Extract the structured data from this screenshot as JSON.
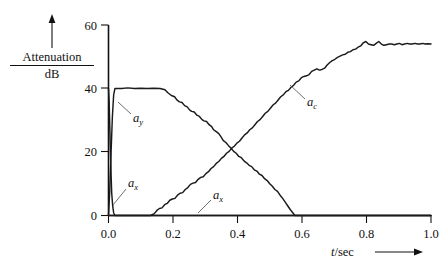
{
  "figure": {
    "background_color": "#ffffff",
    "curve_color": "#1a1a1a",
    "axis_color": "#111111"
  },
  "axes": {
    "y_label_numerator": "Attenuation",
    "y_label_denominator": "dB",
    "y_ticks": [
      "0",
      "20",
      "40",
      "60"
    ],
    "y_tick_values": [
      0,
      20,
      40,
      60
    ],
    "x_ticks": [
      "0.0",
      "0.2",
      "0.4",
      "0.6",
      "0.8",
      "1.0"
    ],
    "x_tick_values": [
      0.0,
      0.2,
      0.4,
      0.6,
      0.8,
      1.0
    ],
    "x_label_italic": "t",
    "x_label_rest": "/sec",
    "x_label": "t/sec"
  },
  "annotations": [
    {
      "name": "label-ay",
      "base": "a",
      "sub": "y",
      "x": 0.35,
      "y": 0.38
    },
    {
      "name": "label-ax-left",
      "base": "a",
      "sub": "x",
      "x": 0.36,
      "y": 0.73
    },
    {
      "name": "label-ax-baseline",
      "base": "a",
      "sub": "x",
      "x": 0.49,
      "y": 0.76
    },
    {
      "name": "label-ac",
      "base": "a",
      "sub": "c",
      "x": 0.73,
      "y": 0.33
    }
  ],
  "chart_data": {
    "type": "line",
    "title": "",
    "xlabel": "t/sec",
    "ylabel": "Attenuation / dB",
    "xlim": [
      0.0,
      1.0
    ],
    "ylim": [
      0,
      60
    ],
    "grid": false,
    "legend": "inline-annotations",
    "series": [
      {
        "name": "a_y",
        "label": "a_y",
        "points": [
          [
            0.0,
            0.0
          ],
          [
            0.004,
            8.0
          ],
          [
            0.008,
            20.0
          ],
          [
            0.012,
            31.0
          ],
          [
            0.016,
            38.0
          ],
          [
            0.02,
            40.0
          ],
          [
            0.04,
            40.0
          ],
          [
            0.06,
            40.2
          ],
          [
            0.08,
            40.0
          ],
          [
            0.1,
            40.1
          ],
          [
            0.12,
            40.0
          ],
          [
            0.14,
            40.1
          ],
          [
            0.16,
            40.0
          ],
          [
            0.175,
            39.6
          ],
          [
            0.185,
            38.6
          ],
          [
            0.195,
            37.8
          ],
          [
            0.205,
            37.4
          ],
          [
            0.212,
            36.4
          ],
          [
            0.22,
            35.8
          ],
          [
            0.228,
            35.6
          ],
          [
            0.236,
            34.6
          ],
          [
            0.244,
            34.2
          ],
          [
            0.252,
            33.2
          ],
          [
            0.258,
            32.8
          ],
          [
            0.266,
            32.6
          ],
          [
            0.274,
            31.6
          ],
          [
            0.282,
            31.2
          ],
          [
            0.29,
            30.2
          ],
          [
            0.296,
            29.8
          ],
          [
            0.304,
            29.6
          ],
          [
            0.312,
            28.6
          ],
          [
            0.32,
            28.0
          ],
          [
            0.326,
            27.0
          ],
          [
            0.334,
            26.4
          ],
          [
            0.342,
            25.8
          ],
          [
            0.35,
            24.6
          ],
          [
            0.356,
            23.6
          ],
          [
            0.364,
            23.0
          ],
          [
            0.372,
            22.0
          ],
          [
            0.38,
            21.2
          ],
          [
            0.388,
            20.2
          ],
          [
            0.396,
            19.6
          ],
          [
            0.404,
            18.6
          ],
          [
            0.412,
            18.2
          ],
          [
            0.42,
            17.2
          ],
          [
            0.428,
            16.6
          ],
          [
            0.436,
            15.8
          ],
          [
            0.444,
            15.4
          ],
          [
            0.452,
            14.4
          ],
          [
            0.46,
            14.0
          ],
          [
            0.468,
            13.0
          ],
          [
            0.476,
            12.6
          ],
          [
            0.484,
            11.6
          ],
          [
            0.492,
            11.0
          ],
          [
            0.5,
            10.0
          ],
          [
            0.508,
            9.2
          ],
          [
            0.516,
            8.2
          ],
          [
            0.524,
            7.6
          ],
          [
            0.532,
            6.4
          ],
          [
            0.54,
            5.4
          ],
          [
            0.548,
            4.2
          ],
          [
            0.556,
            3.0
          ],
          [
            0.564,
            1.8
          ],
          [
            0.572,
            0.8
          ],
          [
            0.578,
            0.0
          ],
          [
            1.0,
            0.0
          ]
        ]
      },
      {
        "name": "a_x",
        "label": "a_x",
        "points": [
          [
            0.0,
            40.0
          ],
          [
            0.002,
            36.0
          ],
          [
            0.004,
            28.0
          ],
          [
            0.006,
            20.0
          ],
          [
            0.008,
            13.0
          ],
          [
            0.01,
            7.0
          ],
          [
            0.013,
            3.0
          ],
          [
            0.016,
            0.8
          ],
          [
            0.02,
            0.0
          ],
          [
            1.0,
            0.0
          ]
        ]
      },
      {
        "name": "a_c",
        "label": "a_c",
        "points": [
          [
            0.0,
            0.0
          ],
          [
            0.1,
            0.0
          ],
          [
            0.13,
            0.0
          ],
          [
            0.142,
            0.6
          ],
          [
            0.15,
            1.6
          ],
          [
            0.158,
            2.2
          ],
          [
            0.166,
            2.4
          ],
          [
            0.174,
            3.4
          ],
          [
            0.182,
            3.8
          ],
          [
            0.19,
            4.8
          ],
          [
            0.198,
            5.2
          ],
          [
            0.206,
            5.4
          ],
          [
            0.214,
            6.4
          ],
          [
            0.222,
            7.0
          ],
          [
            0.23,
            7.2
          ],
          [
            0.238,
            8.2
          ],
          [
            0.246,
            8.8
          ],
          [
            0.254,
            9.8
          ],
          [
            0.262,
            10.2
          ],
          [
            0.27,
            10.4
          ],
          [
            0.278,
            11.4
          ],
          [
            0.286,
            12.0
          ],
          [
            0.294,
            12.2
          ],
          [
            0.302,
            13.2
          ],
          [
            0.31,
            13.8
          ],
          [
            0.318,
            14.8
          ],
          [
            0.326,
            15.4
          ],
          [
            0.334,
            16.4
          ],
          [
            0.342,
            17.0
          ],
          [
            0.35,
            18.0
          ],
          [
            0.358,
            18.6
          ],
          [
            0.366,
            19.6
          ],
          [
            0.374,
            20.2
          ],
          [
            0.382,
            21.2
          ],
          [
            0.39,
            21.8
          ],
          [
            0.398,
            22.8
          ],
          [
            0.406,
            23.4
          ],
          [
            0.414,
            24.4
          ],
          [
            0.422,
            25.4
          ],
          [
            0.43,
            26.0
          ],
          [
            0.438,
            27.0
          ],
          [
            0.446,
            27.6
          ],
          [
            0.454,
            28.6
          ],
          [
            0.462,
            29.6
          ],
          [
            0.47,
            30.2
          ],
          [
            0.478,
            31.2
          ],
          [
            0.486,
            32.2
          ],
          [
            0.494,
            32.8
          ],
          [
            0.502,
            33.8
          ],
          [
            0.51,
            34.8
          ],
          [
            0.518,
            35.4
          ],
          [
            0.526,
            36.4
          ],
          [
            0.534,
            37.4
          ],
          [
            0.542,
            38.0
          ],
          [
            0.55,
            39.0
          ],
          [
            0.558,
            39.4
          ],
          [
            0.566,
            40.4
          ],
          [
            0.574,
            41.0
          ],
          [
            0.582,
            42.0
          ],
          [
            0.59,
            42.4
          ],
          [
            0.598,
            43.4
          ],
          [
            0.606,
            43.8
          ],
          [
            0.614,
            44.0
          ],
          [
            0.622,
            44.4
          ],
          [
            0.63,
            45.4
          ],
          [
            0.638,
            45.8
          ],
          [
            0.646,
            46.2
          ],
          [
            0.654,
            45.8
          ],
          [
            0.662,
            46.0
          ],
          [
            0.67,
            46.4
          ],
          [
            0.678,
            47.4
          ],
          [
            0.686,
            48.2
          ],
          [
            0.694,
            48.8
          ],
          [
            0.702,
            49.2
          ],
          [
            0.71,
            49.8
          ],
          [
            0.718,
            50.2
          ],
          [
            0.726,
            50.6
          ],
          [
            0.734,
            50.8
          ],
          [
            0.742,
            51.4
          ],
          [
            0.75,
            51.6
          ],
          [
            0.758,
            52.2
          ],
          [
            0.766,
            52.4
          ],
          [
            0.774,
            53.0
          ],
          [
            0.782,
            53.4
          ],
          [
            0.79,
            54.4
          ],
          [
            0.798,
            54.8
          ],
          [
            0.806,
            54.0
          ],
          [
            0.814,
            53.8
          ],
          [
            0.822,
            53.6
          ],
          [
            0.83,
            54.2
          ],
          [
            0.838,
            54.8
          ],
          [
            0.846,
            54.0
          ],
          [
            0.854,
            53.6
          ],
          [
            0.862,
            53.8
          ],
          [
            0.87,
            54.0
          ],
          [
            0.878,
            54.0
          ],
          [
            0.886,
            53.8
          ],
          [
            0.894,
            54.0
          ],
          [
            0.902,
            54.2
          ],
          [
            0.91,
            53.8
          ],
          [
            0.918,
            54.0
          ],
          [
            0.926,
            54.2
          ],
          [
            0.934,
            54.0
          ],
          [
            0.942,
            54.0
          ],
          [
            0.95,
            54.2
          ],
          [
            0.958,
            54.0
          ],
          [
            0.966,
            54.0
          ],
          [
            0.974,
            54.2
          ],
          [
            0.982,
            54.0
          ],
          [
            0.99,
            54.1
          ],
          [
            1.0,
            54.0
          ]
        ]
      }
    ]
  }
}
